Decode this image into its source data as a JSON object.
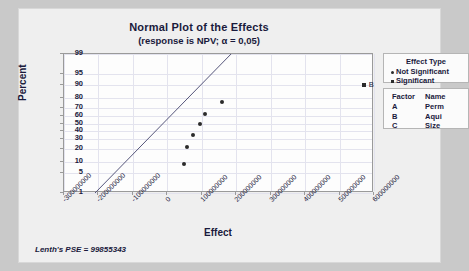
{
  "chart_data": {
    "type": "scatter",
    "title": "Normal Plot of the Effects",
    "subtitle": "(response is NPV; α = 0,05)",
    "xlabel": "Effect",
    "ylabel": "Percent",
    "xlim": [
      -300000000,
      600000000
    ],
    "ylim": [
      1,
      99
    ],
    "grid": true,
    "xticks": [
      -300000000,
      -200000000,
      -100000000,
      0,
      100000000,
      200000000,
      300000000,
      400000000,
      500000000,
      600000000
    ],
    "xticklabels": [
      "-300000000",
      "-200000000",
      "-100000000",
      "0",
      "100000000",
      "200000000",
      "300000000",
      "400000000",
      "500000000",
      "600000000"
    ],
    "yticks": [
      1,
      5,
      10,
      20,
      30,
      40,
      50,
      60,
      70,
      80,
      90,
      95,
      99
    ],
    "yticklabels": [
      "1",
      "5",
      "10",
      "20",
      "30",
      "40",
      "50",
      "60",
      "70",
      "80",
      "90",
      "95",
      "99"
    ],
    "series": [
      {
        "name": "Not Significant",
        "marker": "circle",
        "points": [
          {
            "x": 48000000,
            "y": 9
          },
          {
            "x": 57000000,
            "y": 22
          },
          {
            "x": 75000000,
            "y": 35
          },
          {
            "x": 95000000,
            "y": 50
          },
          {
            "x": 108000000,
            "y": 62
          },
          {
            "x": 160000000,
            "y": 76
          }
        ]
      },
      {
        "name": "Significant",
        "marker": "square",
        "points": [
          {
            "x": 570000000,
            "y": 90,
            "label": "B"
          }
        ]
      }
    ],
    "reference_line": {
      "x_at_y1": -210000000,
      "x_at_y99": 185000000
    },
    "annotations": [
      "B"
    ],
    "footnote": "Lenth's PSE = 99855343"
  },
  "legend": {
    "effect_type": {
      "title": "Effect Type",
      "items": [
        {
          "marker": "circle",
          "label": "Not Significant"
        },
        {
          "marker": "square",
          "label": "Significant"
        }
      ]
    },
    "factors": {
      "headers": [
        "Factor",
        "Name"
      ],
      "rows": [
        {
          "factor": "A",
          "name": "Perm"
        },
        {
          "factor": "B",
          "name": "Aqui"
        },
        {
          "factor": "C",
          "name": "Size"
        }
      ]
    },
    "position": "right"
  },
  "colors": {
    "background": "#c9c9c9",
    "panel": "#efefef",
    "plot_area": "#fdfdfd",
    "text": "#1a1a3c",
    "marker": "#2b2b2b",
    "grid": "#e3e3ee",
    "axis": "#9a9a9a"
  }
}
